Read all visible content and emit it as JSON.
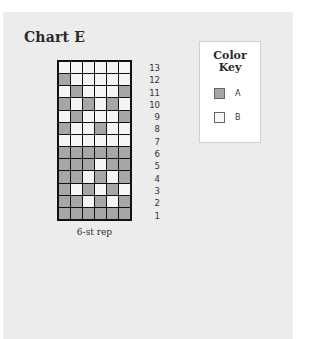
{
  "chart": {
    "title": "Chart E",
    "caption": "6-st rep",
    "columns": 6,
    "row_numbers": [
      "13",
      "12",
      "11",
      "10",
      "9",
      "8",
      "7",
      "6",
      "5",
      "4",
      "3",
      "2",
      "1"
    ],
    "rows_top_to_bottom": [
      [
        "B",
        "B",
        "B",
        "B",
        "B",
        "B"
      ],
      [
        "A",
        "B",
        "B",
        "B",
        "B",
        "B"
      ],
      [
        "B",
        "A",
        "B",
        "B",
        "B",
        "A"
      ],
      [
        "A",
        "B",
        "A",
        "B",
        "A",
        "B"
      ],
      [
        "B",
        "A",
        "B",
        "B",
        "B",
        "A"
      ],
      [
        "A",
        "B",
        "B",
        "A",
        "B",
        "B"
      ],
      [
        "B",
        "B",
        "B",
        "B",
        "B",
        "B"
      ],
      [
        "A",
        "A",
        "A",
        "A",
        "A",
        "A"
      ],
      [
        "A",
        "A",
        "A",
        "B",
        "A",
        "A"
      ],
      [
        "A",
        "A",
        "B",
        "A",
        "B",
        "A"
      ],
      [
        "A",
        "B",
        "A",
        "B",
        "A",
        "B"
      ],
      [
        "A",
        "A",
        "B",
        "A",
        "B",
        "A"
      ],
      [
        "A",
        "A",
        "A",
        "A",
        "A",
        "A"
      ]
    ]
  },
  "key": {
    "title_line1": "Color",
    "title_line2": "Key",
    "items": [
      {
        "label": "A",
        "color": "#a6a6a6"
      },
      {
        "label": "B",
        "color": "#f5f5f5"
      }
    ]
  },
  "colors": {
    "panel_bg": "#ececec",
    "grid_line": "#111111",
    "color_A": "#a6a6a6",
    "color_B": "#f5f5f5"
  }
}
